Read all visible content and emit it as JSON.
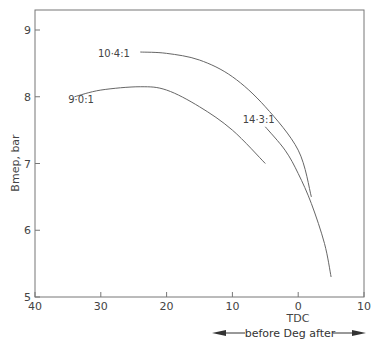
{
  "header": {
    "running_title": "COMBUSTION AND COMBUSTION CHAMBERS"
  },
  "chart_data": {
    "type": "line",
    "title": "",
    "xlabel": "TDC",
    "x_direction_caption": "before Deg after",
    "x_direction_left": "before",
    "x_direction_unit": "Deg",
    "x_direction_right": "after",
    "ylabel": "Bmep, bar",
    "xlim": [
      40,
      -10
    ],
    "ylim": [
      5,
      9
    ],
    "x_tick_values": [
      40,
      30,
      20,
      10,
      0,
      -10
    ],
    "x_tick_labels": [
      "40",
      "30",
      "20",
      "10",
      "0",
      "10"
    ],
    "y_tick_values": [
      5,
      6,
      7,
      8,
      9
    ],
    "y_tick_labels": [
      "5",
      "6",
      "7",
      "8",
      "9"
    ],
    "grid": false,
    "legend": "inline labels",
    "series": [
      {
        "name": "9·0:1",
        "x": [
          34,
          30,
          24,
          20,
          15,
          10,
          5
        ],
        "values": [
          8.0,
          8.1,
          8.15,
          8.1,
          7.85,
          7.5,
          7.0
        ],
        "label_pos": [
          33,
          7.9
        ]
      },
      {
        "name": "10·4:1",
        "x": [
          24,
          20,
          15,
          10,
          5,
          0,
          -2
        ],
        "values": [
          8.67,
          8.65,
          8.55,
          8.3,
          7.85,
          7.2,
          6.5
        ],
        "label_pos": [
          28,
          8.6
        ]
      },
      {
        "name": "14·3:1",
        "x": [
          5,
          2,
          0,
          -2,
          -4,
          -5
        ],
        "values": [
          7.55,
          7.2,
          6.85,
          6.4,
          5.8,
          5.3
        ],
        "label_pos": [
          6,
          7.6
        ]
      }
    ]
  }
}
